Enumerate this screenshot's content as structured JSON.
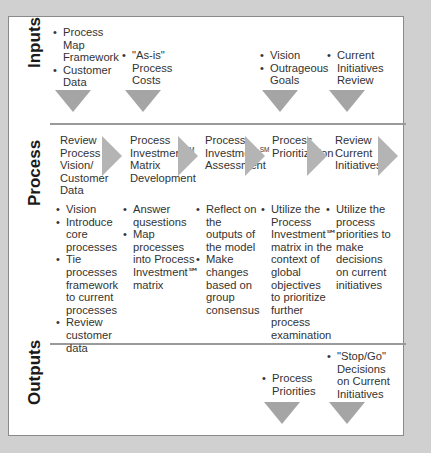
{
  "colors": {
    "background": "#d0d0d0",
    "panel": "#ffffff",
    "arrow": "#a5a5a5",
    "divider": "#9a9a9a",
    "text": "#333333"
  },
  "sections": {
    "inputs": {
      "label": "Inputs",
      "items": [
        {
          "bullets": [
            "Process Map Framework",
            "Customer Data"
          ]
        },
        {
          "bullets": [
            "\"As-is\" Process Costs"
          ]
        },
        {
          "bullets": []
        },
        {
          "bullets": [
            "Vision",
            "Outrageous Goals"
          ]
        },
        {
          "bullets": [
            "Current Initiatives Review"
          ]
        }
      ]
    },
    "process": {
      "label": "Process",
      "steps": [
        {
          "title": "Review Process Vision/ Customer Data",
          "bullets": [
            "Vision",
            "Introduce core processes",
            "Tie processes framework to current processes",
            "Review customer data"
          ]
        },
        {
          "title_parts": [
            "Process Investment",
            "SM",
            " Matrix Development"
          ],
          "bullets": [
            "Answer qusestions",
            "Map processes into Process Investment℠ matrix"
          ]
        },
        {
          "title_parts": [
            "Process Investment",
            "SM",
            " Assessment"
          ],
          "bullets": [
            "Reflect on the outputs of the model",
            "Make changes based on group consensus"
          ]
        },
        {
          "title": "Process Prioritization",
          "bullets": [
            "Utilize the Process Investment℠ matrix in the context of global objectives to prioritize further process examination"
          ]
        },
        {
          "title": "Review Current Initiatives",
          "bullets": [
            "Utilize the process priorities to make decisions on current initiatives"
          ]
        }
      ]
    },
    "outputs": {
      "label": "Outputs",
      "items": [
        {
          "bullets": [
            "Process Priorities"
          ]
        },
        {
          "bullets": [
            "\"Stop/Go\" Decisions on Current Initiatives"
          ]
        }
      ]
    }
  }
}
